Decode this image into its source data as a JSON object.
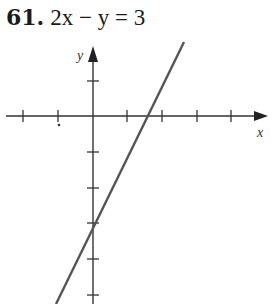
{
  "problem": {
    "number": "61.",
    "equation": "2x − y = 3"
  },
  "graph": {
    "x_axis_label": "x",
    "y_axis_label": "y",
    "line": {
      "slope": 2,
      "y_intercept": -3,
      "x_intercept": 1.5
    },
    "tick_spacing_px": 34.5,
    "origin_px": [
      93,
      116
    ],
    "x_ticks": [
      -2,
      -1,
      1,
      2,
      3,
      4
    ],
    "y_ticks": [
      1,
      -1,
      -2,
      -3,
      -4,
      -5
    ],
    "colors": {
      "axis": "#333333",
      "line": "#555555"
    }
  }
}
